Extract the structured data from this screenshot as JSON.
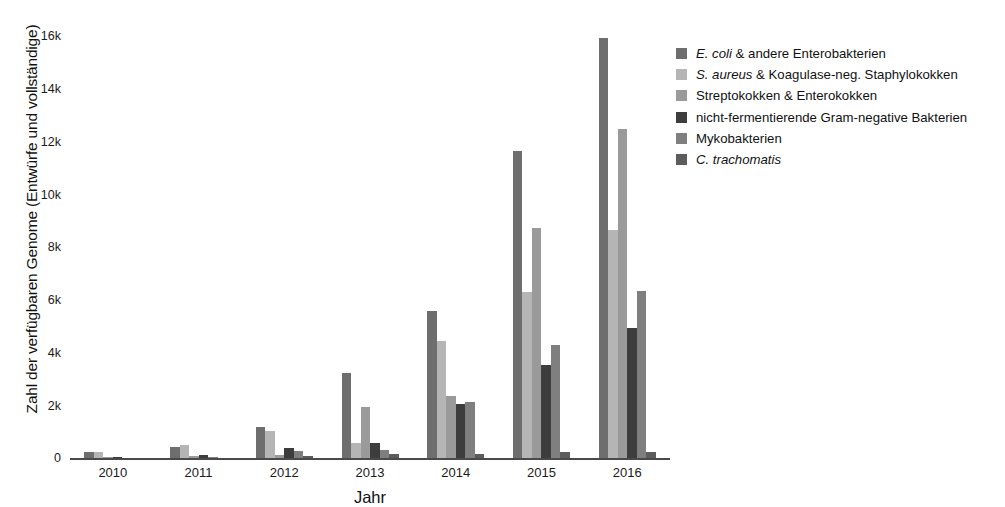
{
  "chart_data": {
    "type": "bar",
    "title": "",
    "xlabel": "Jahr",
    "ylabel": "Zahl der verfügbaren Genome (Entwürfe und vollständige)",
    "categories": [
      "2010",
      "2011",
      "2012",
      "2013",
      "2014",
      "2015",
      "2016"
    ],
    "ylim": [
      0,
      16000
    ],
    "yticks": [
      0,
      2000,
      4000,
      6000,
      8000,
      10000,
      12000,
      14000,
      16000
    ],
    "ytick_labels": [
      "0",
      "2k",
      "4k",
      "6k",
      "8k",
      "10k",
      "12k",
      "14k",
      "16k"
    ],
    "grid": false,
    "legend_position": "right",
    "series": [
      {
        "name": "E. coli & andere Enterobakterien",
        "name_italic": "E. coli",
        "name_rest": " & andere Enterobakterien",
        "color": "#6e6e6e",
        "values": [
          250,
          450,
          1200,
          3250,
          5600,
          11650,
          15950
        ]
      },
      {
        "name": "S. aureus & Koagulase-neg. Staphylokokken",
        "name_italic": "S. aureus",
        "name_rest": " & Koagulase-neg. Staphylokokken",
        "color": "#b5b5b5",
        "values": [
          230,
          520,
          1050,
          600,
          4450,
          6300,
          8650
        ]
      },
      {
        "name": "Streptokokken & Enterokokken",
        "name_italic": "",
        "name_rest": "Streptokokken & Enterokokken",
        "color": "#9a9a9a",
        "values": [
          60,
          90,
          120,
          1950,
          2350,
          8750,
          12500
        ]
      },
      {
        "name": "nicht-fermentierende Gram-negative Bakterien",
        "name_italic": "",
        "name_rest": "nicht-fermentierende Gram-negative Bakterien",
        "color": "#3d3d3d",
        "values": [
          40,
          130,
          400,
          600,
          2050,
          3550,
          4950
        ]
      },
      {
        "name": "Mykobakterien",
        "name_italic": "",
        "name_rest": "Mykobakterien",
        "color": "#7f7f7f",
        "values": [
          20,
          60,
          300,
          330,
          2150,
          4300,
          6350
        ]
      },
      {
        "name": "C. trachomatis",
        "name_italic": "C. trachomatis",
        "name_rest": "",
        "color": "#5c5c5c",
        "values": [
          10,
          30,
          110,
          150,
          170,
          230,
          250
        ]
      }
    ]
  }
}
